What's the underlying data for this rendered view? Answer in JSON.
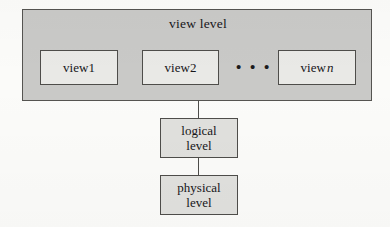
{
  "diagram": {
    "view_level": {
      "label": "view level",
      "views": [
        {
          "label": "view ",
          "suffix": "1"
        },
        {
          "label": "view ",
          "suffix": "2"
        },
        {
          "label": "view ",
          "suffix": "n"
        }
      ],
      "ellipsis": "• • •"
    },
    "logical_level": {
      "line1": "logical",
      "line2": "level"
    },
    "physical_level": {
      "line1": "physical",
      "line2": "level"
    }
  },
  "colors": {
    "band_fill": "#c9c9c7",
    "box_fill": "#e9e9e6",
    "level_box_fill": "#e0e0dd",
    "stroke": "#4e4d4a",
    "text": "#17161a",
    "page_background": "#fbfbf9"
  }
}
